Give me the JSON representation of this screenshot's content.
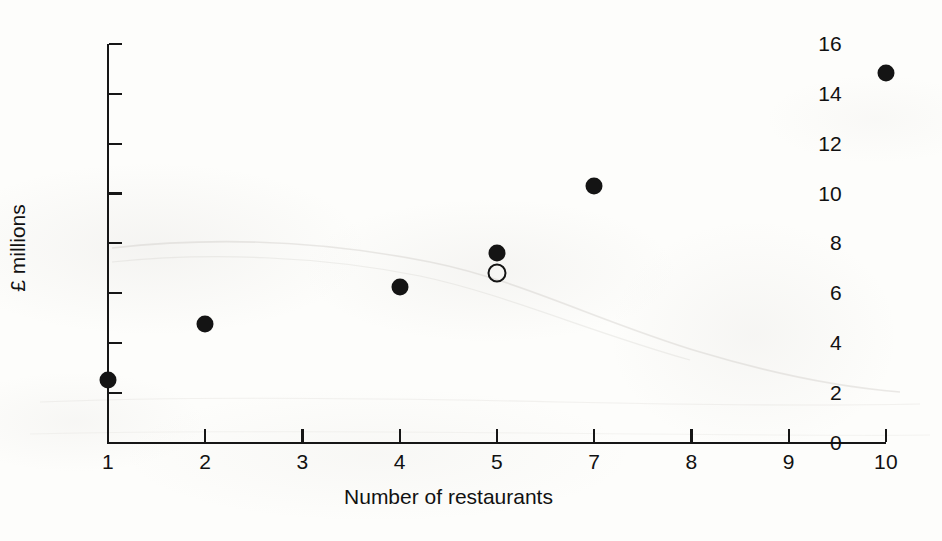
{
  "chart_data": {
    "type": "scatter",
    "title": "",
    "subtitle": "",
    "xlabel": "Number of restaurants",
    "ylabel": "£ millions",
    "xlim": [
      1,
      10
    ],
    "ylim": [
      0,
      16
    ],
    "grid": false,
    "legend": null,
    "x_tick_labels": [
      "1",
      "2",
      "3",
      "4",
      "5",
      "7",
      "8",
      "9",
      "10"
    ],
    "y_tick_labels": [
      "0",
      "2",
      "4",
      "6",
      "8",
      "10",
      "12",
      "14",
      "16"
    ],
    "y_ticks": [
      0,
      2,
      4,
      6,
      8,
      10,
      12,
      14,
      16
    ],
    "x_tick_slots": [
      0,
      1,
      2,
      3,
      4,
      5,
      6,
      7,
      8
    ],
    "series": [
      {
        "name": "filled-markers",
        "marker": "filled-circle",
        "color": "#141414",
        "points": [
          {
            "slot": 0,
            "x": "1",
            "y": 2.5
          },
          {
            "slot": 1,
            "x": "2",
            "y": 4.75
          },
          {
            "slot": 3,
            "x": "4",
            "y": 6.25
          },
          {
            "slot": 4,
            "x": "5",
            "y": 7.6
          },
          {
            "slot": 5,
            "x": "7",
            "y": 10.3
          },
          {
            "slot": 8,
            "x": "10",
            "y": 14.85
          }
        ]
      },
      {
        "name": "open-marker",
        "marker": "open-circle",
        "color": "#141414",
        "points": [
          {
            "slot": 4,
            "x": "5",
            "y": 6.8
          }
        ]
      }
    ],
    "colors": {
      "ink": "#141414",
      "axis": "#161616",
      "paper": "#fdfdfb"
    }
  }
}
